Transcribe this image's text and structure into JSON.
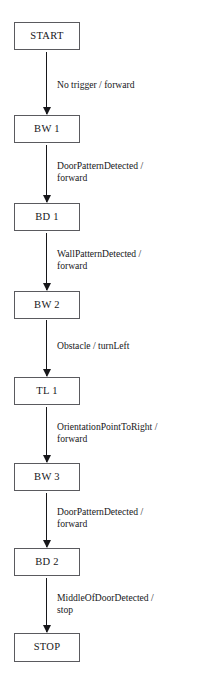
{
  "diagram": {
    "type": "state-machine-flowchart",
    "orientation": "vertical",
    "background_color": "#ffffff",
    "box_border_color": "#5a5a5e",
    "arrow_color": "#17171a",
    "text_color": "#17171a",
    "states": [
      {
        "id": "start",
        "label": "START",
        "x": 14,
        "y": 22,
        "width": 66,
        "height": 28
      },
      {
        "id": "bw1",
        "label": "BW 1",
        "x": 14,
        "y": 115,
        "width": 66,
        "height": 28
      },
      {
        "id": "bd1",
        "label": "BD 1",
        "x": 14,
        "y": 203,
        "width": 66,
        "height": 28
      },
      {
        "id": "bw2",
        "label": "BW 2",
        "x": 14,
        "y": 291,
        "width": 66,
        "height": 28
      },
      {
        "id": "tl1",
        "label": "TL 1",
        "x": 14,
        "y": 377,
        "width": 66,
        "height": 28
      },
      {
        "id": "bw3",
        "label": "BW 3",
        "x": 14,
        "y": 463,
        "width": 66,
        "height": 28
      },
      {
        "id": "bd2",
        "label": "BD 2",
        "x": 14,
        "y": 548,
        "width": 66,
        "height": 28
      },
      {
        "id": "stop",
        "label": "STOP",
        "x": 14,
        "y": 633,
        "width": 66,
        "height": 29
      }
    ],
    "transitions": [
      {
        "id": "t1",
        "from": "START",
        "to": "BW 1",
        "event": "No trigger",
        "action": "forward",
        "label": "No trigger / forward",
        "label_lines": 1,
        "arrow_top": 52,
        "arrow_height": 62,
        "label_top": 79
      },
      {
        "id": "t2",
        "from": "BW 1",
        "to": "BD 1",
        "event": "DoorPatternDetected",
        "action": "forward",
        "label": "DoorPatternDetected /\nforward",
        "label_lines": 2,
        "arrow_top": 145,
        "arrow_height": 57,
        "label_top": 160
      },
      {
        "id": "t3",
        "from": "BD 1",
        "to": "BW 2",
        "event": "WallPatternDetected",
        "action": "forward",
        "label": "WallPatternDetected /\nforward",
        "label_lines": 2,
        "arrow_top": 233,
        "arrow_height": 57,
        "label_top": 248
      },
      {
        "id": "t4",
        "from": "BW 2",
        "to": "TL 1",
        "event": "Obstacle",
        "action": "turnLeft",
        "label": "Obstacle / turnLeft",
        "label_lines": 1,
        "arrow_top": 320,
        "arrow_height": 56,
        "label_top": 340
      },
      {
        "id": "t5",
        "from": "TL 1",
        "to": "BW 3",
        "event": "OrientationPointToRight",
        "action": "forward",
        "label": "OrientationPointToRight /\nforward",
        "label_lines": 2,
        "arrow_top": 407,
        "arrow_height": 55,
        "label_top": 421
      },
      {
        "id": "t6",
        "from": "BW 3",
        "to": "BD 2",
        "event": "DoorPatternDetected",
        "action": "forward",
        "label": "DoorPatternDetected /\nforward",
        "label_lines": 2,
        "arrow_top": 493,
        "arrow_height": 54,
        "label_top": 506
      },
      {
        "id": "t7",
        "from": "BD 2",
        "to": "STOP",
        "event": "MiddleOfDoorDetected",
        "action": "stop",
        "label": "MiddleOfDoorDetected /\nstop",
        "label_lines": 2,
        "arrow_top": 578,
        "arrow_height": 54,
        "label_top": 592
      }
    ]
  }
}
